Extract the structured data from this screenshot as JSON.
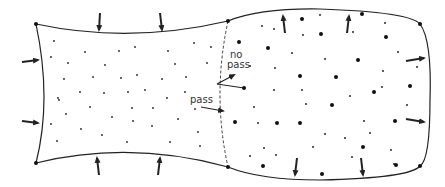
{
  "diagram": {
    "labels": {
      "no_pass_line1": "no",
      "no_pass_line2": "pass",
      "pass": "pass"
    },
    "colors": {
      "stroke": "#222222",
      "background": "#ffffff",
      "text": "#333333"
    },
    "regions": [
      {
        "name": "left-region",
        "description": "compressed region with small particles"
      },
      {
        "name": "right-region",
        "description": "expanded region with mixed small and large particles"
      }
    ],
    "boundary": {
      "style": "dashed",
      "description": "interface between regions"
    },
    "arrows": {
      "left_region": [
        "top-inward-1",
        "top-inward-2",
        "left-inward-1",
        "left-inward-2",
        "bottom-inward-1",
        "bottom-inward-2"
      ],
      "right_region": [
        "top-outward-1",
        "top-outward-2",
        "right-outward-1",
        "right-outward-2",
        "bottom-outward-1",
        "bottom-outward-2"
      ]
    }
  }
}
